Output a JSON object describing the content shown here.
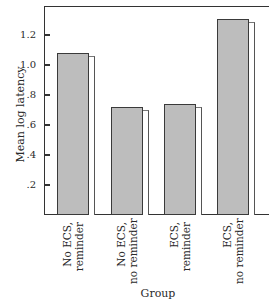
{
  "chart_data": {
    "type": "bar",
    "title": "",
    "xlabel": "Group",
    "ylabel": "Mean log latency",
    "ylim": [
      0,
      1.39
    ],
    "yticks": [
      ".2",
      ".4",
      ".6",
      ".8",
      "1.0",
      "1.2"
    ],
    "ytick_values": [
      0.2,
      0.4,
      0.6,
      0.8,
      1.0,
      1.2
    ],
    "categories": [
      "No ECS, reminder",
      "No ECS, no reminder",
      "ECS, reminder",
      "ECS, no reminder"
    ],
    "category_lines": [
      [
        "No ECS,",
        "reminder"
      ],
      [
        "No ECS,",
        "no reminder"
      ],
      [
        "ECS,",
        "reminder"
      ],
      [
        "ECS,",
        "no reminder"
      ]
    ],
    "values": [
      1.08,
      0.72,
      0.74,
      1.31
    ],
    "bar_color": "#bdbdbd",
    "grid": false,
    "legend": null
  }
}
